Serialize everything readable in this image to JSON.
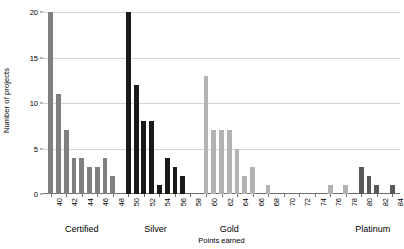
{
  "chart_data": {
    "type": "bar",
    "title": "",
    "xlabel": "Points earned",
    "ylabel": "Number of projects",
    "ylim": [
      0,
      20
    ],
    "xlim": [
      39,
      85
    ],
    "yticks": [
      0,
      5,
      10,
      15,
      20
    ],
    "xticks": [
      40,
      42,
      44,
      46,
      48,
      50,
      52,
      54,
      56,
      58,
      60,
      62,
      64,
      66,
      68,
      70,
      72,
      74,
      76,
      78,
      80,
      82,
      84
    ],
    "grid": "horizontal",
    "legend": "none",
    "colors": {
      "certified": "#808080",
      "silver": "#1a1a1a",
      "gold": "#b3b3b3",
      "platinum": "#595959",
      "gridline": "#d4d4d4",
      "axis": "#6e6e6e",
      "text": "#000000",
      "background": "#ffffff"
    },
    "category_labels": [
      {
        "label": "Certified",
        "center_x": 44
      },
      {
        "label": "Silver",
        "center_x": 53.5
      },
      {
        "label": "Gold",
        "center_x": 63
      },
      {
        "label": "Platinum",
        "center_x": 81.5
      }
    ],
    "series": [
      {
        "name": "Certified",
        "color_key": "certified",
        "points": [
          {
            "x": 40,
            "y": 20
          },
          {
            "x": 41,
            "y": 11
          },
          {
            "x": 42,
            "y": 7
          },
          {
            "x": 43,
            "y": 4
          },
          {
            "x": 44,
            "y": 4
          },
          {
            "x": 45,
            "y": 3
          },
          {
            "x": 46,
            "y": 3
          },
          {
            "x": 47,
            "y": 4
          },
          {
            "x": 48,
            "y": 2
          }
        ]
      },
      {
        "name": "Silver",
        "color_key": "silver",
        "points": [
          {
            "x": 50,
            "y": 20
          },
          {
            "x": 51,
            "y": 12
          },
          {
            "x": 52,
            "y": 8
          },
          {
            "x": 53,
            "y": 8
          },
          {
            "x": 54,
            "y": 1
          },
          {
            "x": 55,
            "y": 4
          },
          {
            "x": 56,
            "y": 3
          },
          {
            "x": 57,
            "y": 2
          }
        ]
      },
      {
        "name": "Gold",
        "color_key": "gold",
        "points": [
          {
            "x": 60,
            "y": 13
          },
          {
            "x": 61,
            "y": 7
          },
          {
            "x": 62,
            "y": 7
          },
          {
            "x": 63,
            "y": 7
          },
          {
            "x": 64,
            "y": 5
          },
          {
            "x": 65,
            "y": 2
          },
          {
            "x": 66,
            "y": 3
          },
          {
            "x": 68,
            "y": 1
          },
          {
            "x": 76,
            "y": 1
          },
          {
            "x": 78,
            "y": 1
          }
        ]
      },
      {
        "name": "Platinum",
        "color_key": "platinum",
        "points": [
          {
            "x": 80,
            "y": 3
          },
          {
            "x": 81,
            "y": 2
          },
          {
            "x": 82,
            "y": 1
          },
          {
            "x": 84,
            "y": 1
          }
        ]
      }
    ]
  }
}
